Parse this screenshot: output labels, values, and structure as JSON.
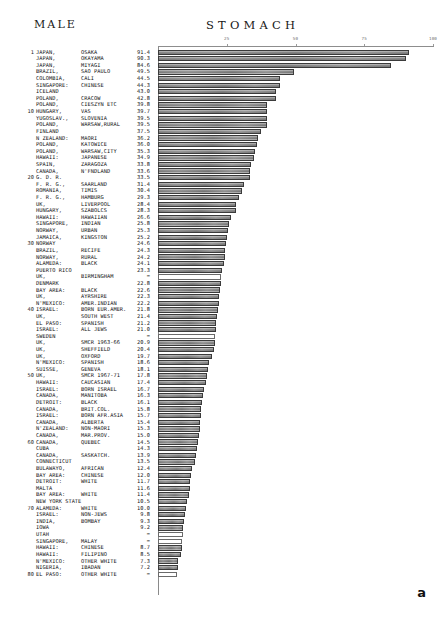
{
  "header": {
    "sex": "MALE",
    "site": "STOMACH"
  },
  "figure_label": "a",
  "chart_data": {
    "type": "bar",
    "title": "STOMACH",
    "subtitle": "MALE",
    "orientation": "horizontal",
    "xlabel": "",
    "ylabel": "",
    "xlim": [
      0,
      100
    ],
    "ticks": [
      25,
      50,
      75,
      100
    ],
    "tick_labels": [
      "25",
      "50",
      "75",
      "100"
    ],
    "grid": false,
    "legend": "none",
    "missing_value_marker": "=",
    "categories": [
      "JAPAN, OSAKA",
      "JAPAN, OKAYAMA",
      "JAPAN, MIYAGI",
      "BRAZIL, SAO PAULO",
      "COLOMBIA, CALI",
      "SINGAPORE: CHINESE",
      "ICELAND",
      "POLAND, CRACOW",
      "POLAND, CIESZYN ETC",
      "HUNGARY, VAS",
      "YUGOSLAV., SLOVENIA",
      "POLAND, WARSAW,RURAL",
      "FINLAND",
      "N ZEALAND: MAORI",
      "POLAND, KATOWICE",
      "POLAND, WARSAW,CITY",
      "HAWAII: JAPANESE",
      "SPAIN, ZARAGOZA",
      "CANADA, N'FNDLAND",
      "G. D. R.",
      "F. R. G., SAARLAND",
      "ROMANIA, TIMIS",
      "F. R. G., HAMBURG",
      "UK, LIVERPOOL",
      "HUNGARY, SZABOLCS",
      "HAWAII: HAWAIIAN",
      "SINGAPORE, INDIAN",
      "NORWAY, URBAN",
      "JAMAICA, KINGSTON",
      "NORWAY",
      "BRAZIL, RECIFE",
      "NORWAY, RURAL",
      "ALAMEDA: BLACK",
      "PUERTO RICO",
      "UK, BIRMINGHAM",
      "DENMARK",
      "BAY AREA: BLACK",
      "UK, AYRSHIRE",
      "N'MEXICO: AMER.INDIAN",
      "ISRAEL: BORN EUR.AMER.",
      "UK, SOUTH WEST",
      "EL PASO: SPANISH",
      "ISRAEL: ALL JEWS",
      "SWEDEN",
      "UK, SMCR 1963-66",
      "UK, SHEFFIELD",
      "UK, OXFORD",
      "N'MEXICO: SPANISH",
      "SUISSE, GENEVA",
      "UK, SMCR 1967-71",
      "HAWAII: CAUCASIAN",
      "ISRAEL: BORN ISRAEL",
      "CANADA, MANITOBA",
      "DETROIT: BLACK",
      "CANADA, BRIT.COL.",
      "ISRAEL: BORN AFR.ASIA",
      "CANADA, ALBERTA",
      "N'ZEALAND: NON-MAORI",
      "CANADA, MAR.PROV.",
      "CANADA, QUEBEC",
      "CUBA",
      "CANADA, SASKATCH.",
      "CONNECTICUT",
      "BULAWAYO, AFRICAN",
      "BAY AREA: CHINESE",
      "DETROIT: WHITE",
      "MALTA",
      "BAY AREA: WHITE",
      "NEW YORK STATE",
      "ALAMEDA: WHITE",
      "ISRAEL: NON-JEWS",
      "INDIA, BOMBAY",
      "IOWA",
      "UTAH",
      "SINGAPORE, MALAY",
      "HAWAII: CHINESE",
      "HAWAII: FILIPINO",
      "N'MEXICO: OTHER WHITE",
      "NIGERIA, IBADAN",
      "EL PASO: OTHER WHITE"
    ],
    "values": [
      91.4,
      90.3,
      84.6,
      49.5,
      44.5,
      44.3,
      43.0,
      42.8,
      39.8,
      39.7,
      39.5,
      39.5,
      37.5,
      36.2,
      36.0,
      35.3,
      34.9,
      33.8,
      33.6,
      33.5,
      31.4,
      30.4,
      29.3,
      28.4,
      28.3,
      26.6,
      25.8,
      25.3,
      25.2,
      24.6,
      24.3,
      24.2,
      24.1,
      23.3,
      null,
      22.8,
      22.6,
      22.3,
      22.2,
      21.8,
      21.4,
      21.2,
      21.0,
      null,
      20.9,
      20.4,
      19.7,
      18.6,
      18.1,
      17.8,
      17.4,
      16.7,
      16.3,
      16.1,
      15.8,
      15.7,
      15.4,
      15.3,
      15.0,
      14.5,
      14.3,
      13.9,
      13.5,
      12.4,
      12.0,
      11.7,
      11.6,
      11.4,
      10.5,
      10.0,
      9.8,
      9.3,
      9.2,
      null,
      null,
      8.7,
      8.5,
      7.3,
      7.2,
      null
    ]
  },
  "rows": [
    {
      "rank": "1",
      "country": "JAPAN,",
      "region": "OSAKA",
      "value": "91.4",
      "v": 91.4
    },
    {
      "rank": "",
      "country": "JAPAN,",
      "region": "OKAYAMA",
      "value": "90.3",
      "v": 90.3
    },
    {
      "rank": "",
      "country": "JAPAN,",
      "region": "MIYAGI",
      "value": "84.6",
      "v": 84.6
    },
    {
      "rank": "",
      "country": "BRAZIL,",
      "region": "SAO PAULO",
      "value": "49.5",
      "v": 49.5
    },
    {
      "rank": "",
      "country": "COLOMBIA,",
      "region": "CALI",
      "value": "44.5",
      "v": 44.5
    },
    {
      "rank": "",
      "country": "SINGAPORE:",
      "region": "CHINESE",
      "value": "44.3",
      "v": 44.3
    },
    {
      "rank": "",
      "country": "ICELAND",
      "region": "",
      "value": "43.0",
      "v": 43.0
    },
    {
      "rank": "",
      "country": "POLAND,",
      "region": "CRACOW",
      "value": "42.8",
      "v": 42.8
    },
    {
      "rank": "",
      "country": "POLAND,",
      "region": "CIESZYN ETC",
      "value": "39.8",
      "v": 39.8
    },
    {
      "rank": "10",
      "country": "HUNGARY,",
      "region": "VAS",
      "value": "39.7",
      "v": 39.7
    },
    {
      "rank": "",
      "country": "YUGOSLAV.,",
      "region": "SLOVENIA",
      "value": "39.5",
      "v": 39.5
    },
    {
      "rank": "",
      "country": "POLAND,",
      "region": "WARSAW,RURAL",
      "value": "39.5",
      "v": 39.5
    },
    {
      "rank": "",
      "country": "FINLAND",
      "region": "",
      "value": "37.5",
      "v": 37.5
    },
    {
      "rank": "",
      "country": "N ZEALAND:",
      "region": "MAORI",
      "value": "36.2",
      "v": 36.2
    },
    {
      "rank": "",
      "country": "POLAND,",
      "region": "KATOWICE",
      "value": "36.0",
      "v": 36.0
    },
    {
      "rank": "",
      "country": "POLAND,",
      "region": "WARSAW,CITY",
      "value": "35.3",
      "v": 35.3
    },
    {
      "rank": "",
      "country": "HAWAII:",
      "region": "JAPANESE",
      "value": "34.9",
      "v": 34.9
    },
    {
      "rank": "",
      "country": "SPAIN,",
      "region": "ZARAGOZA",
      "value": "33.8",
      "v": 33.8
    },
    {
      "rank": "",
      "country": "CANADA,",
      "region": "N'FNDLAND",
      "value": "33.6",
      "v": 33.6
    },
    {
      "rank": "20",
      "country": "G. D. R.",
      "region": "",
      "value": "33.5",
      "v": 33.5
    },
    {
      "rank": "",
      "country": "F. R. G.,",
      "region": "SAARLAND",
      "value": "31.4",
      "v": 31.4
    },
    {
      "rank": "",
      "country": "ROMANIA,",
      "region": "TIMIS",
      "value": "30.4",
      "v": 30.4
    },
    {
      "rank": "",
      "country": "F. R. G.,",
      "region": "HAMBURG",
      "value": "29.3",
      "v": 29.3
    },
    {
      "rank": "",
      "country": "UK,",
      "region": "LIVERPOOL",
      "value": "28.4",
      "v": 28.4
    },
    {
      "rank": "",
      "country": "HUNGARY,",
      "region": "SZABOLCS",
      "value": "28.3",
      "v": 28.3
    },
    {
      "rank": "",
      "country": "HAWAII:",
      "region": "HAWAIIAN",
      "value": "26.6",
      "v": 26.6
    },
    {
      "rank": "",
      "country": "SINGAPORE,",
      "region": "INDIAN",
      "value": "25.8",
      "v": 25.8
    },
    {
      "rank": "",
      "country": "NORWAY,",
      "region": "URBAN",
      "value": "25.3",
      "v": 25.3
    },
    {
      "rank": "",
      "country": "JAMAICA,",
      "region": "KINGSTON",
      "value": "25.2",
      "v": 25.2
    },
    {
      "rank": "30",
      "country": "NORWAY",
      "region": "",
      "value": "24.6",
      "v": 24.6
    },
    {
      "rank": "",
      "country": "BRAZIL,",
      "region": "RECIFE",
      "value": "24.3",
      "v": 24.3
    },
    {
      "rank": "",
      "country": "NORWAY,",
      "region": "RURAL",
      "value": "24.2",
      "v": 24.2
    },
    {
      "rank": "",
      "country": "ALAMEDA:",
      "region": "BLACK",
      "value": "24.1",
      "v": 24.1
    },
    {
      "rank": "",
      "country": "PUERTO RICO",
      "region": "",
      "value": "23.3",
      "v": 23.3
    },
    {
      "rank": "",
      "country": "UK,",
      "region": "BIRMINGHAM",
      "value": "=",
      "v": 23.0
    },
    {
      "rank": "",
      "country": "DENMARK",
      "region": "",
      "value": "22.8",
      "v": 22.8
    },
    {
      "rank": "",
      "country": "BAY AREA:",
      "region": "BLACK",
      "value": "22.6",
      "v": 22.6
    },
    {
      "rank": "",
      "country": "UK,",
      "region": "AYRSHIRE",
      "value": "22.3",
      "v": 22.3
    },
    {
      "rank": "",
      "country": "N'MEXICO:",
      "region": "AMER.INDIAN",
      "value": "22.2",
      "v": 22.2
    },
    {
      "rank": "40",
      "country": "ISRAEL:",
      "region": "BORN EUR.AMER.",
      "value": "21.8",
      "v": 21.8
    },
    {
      "rank": "",
      "country": "UK,",
      "region": "SOUTH WEST",
      "value": "21.4",
      "v": 21.4
    },
    {
      "rank": "",
      "country": "EL PASO:",
      "region": "SPANISH",
      "value": "21.2",
      "v": 21.2
    },
    {
      "rank": "",
      "country": "ISRAEL:",
      "region": "ALL JEWS",
      "value": "21.0",
      "v": 21.0
    },
    {
      "rank": "",
      "country": "SWEDEN",
      "region": "",
      "value": "=",
      "v": 20.9
    },
    {
      "rank": "",
      "country": "UK,",
      "region": "SMCR 1963-66",
      "value": "20.9",
      "v": 20.9
    },
    {
      "rank": "",
      "country": "UK,",
      "region": "SHEFFIELD",
      "value": "20.4",
      "v": 20.4
    },
    {
      "rank": "",
      "country": "UK,",
      "region": "OXFORD",
      "value": "19.7",
      "v": 19.7
    },
    {
      "rank": "",
      "country": "N'MEXICO:",
      "region": "SPANISH",
      "value": "18.6",
      "v": 18.6
    },
    {
      "rank": "",
      "country": "SUISSE,",
      "region": "GENEVA",
      "value": "18.1",
      "v": 18.1
    },
    {
      "rank": "50",
      "country": "UK,",
      "region": "SMCR 1967-71",
      "value": "17.8",
      "v": 17.8
    },
    {
      "rank": "",
      "country": "HAWAII:",
      "region": "CAUCASIAN",
      "value": "17.4",
      "v": 17.4
    },
    {
      "rank": "",
      "country": "ISRAEL:",
      "region": "BORN ISRAEL",
      "value": "16.7",
      "v": 16.7
    },
    {
      "rank": "",
      "country": "CANADA,",
      "region": "MANITOBA",
      "value": "16.3",
      "v": 16.3
    },
    {
      "rank": "",
      "country": "DETROIT:",
      "region": "BLACK",
      "value": "16.1",
      "v": 16.1
    },
    {
      "rank": "",
      "country": "CANADA,",
      "region": "BRIT.COL.",
      "value": "15.8",
      "v": 15.8
    },
    {
      "rank": "",
      "country": "ISRAEL:",
      "region": "BORN AFR.ASIA",
      "value": "15.7",
      "v": 15.7
    },
    {
      "rank": "",
      "country": "CANADA,",
      "region": "ALBERTA",
      "value": "15.4",
      "v": 15.4
    },
    {
      "rank": "",
      "country": "N'ZEALAND:",
      "region": "NON-MAORI",
      "value": "15.3",
      "v": 15.3
    },
    {
      "rank": "",
      "country": "CANADA,",
      "region": "MAR.PROV.",
      "value": "15.0",
      "v": 15.0
    },
    {
      "rank": "60",
      "country": "CANADA,",
      "region": "QUEBEC",
      "value": "14.5",
      "v": 14.5
    },
    {
      "rank": "",
      "country": "CUBA",
      "region": "",
      "value": "14.3",
      "v": 14.3
    },
    {
      "rank": "",
      "country": "CANADA,",
      "region": "SASKATCH.",
      "value": "13.9",
      "v": 13.9
    },
    {
      "rank": "",
      "country": "CONNECTICUT",
      "region": "",
      "value": "13.5",
      "v": 13.5
    },
    {
      "rank": "",
      "country": "BULAWAYO,",
      "region": "AFRICAN",
      "value": "12.4",
      "v": 12.4
    },
    {
      "rank": "",
      "country": "BAY AREA:",
      "region": "CHINESE",
      "value": "12.0",
      "v": 12.0
    },
    {
      "rank": "",
      "country": "DETROIT:",
      "region": "WHITE",
      "value": "11.7",
      "v": 11.7
    },
    {
      "rank": "",
      "country": "MALTA",
      "region": "",
      "value": "11.6",
      "v": 11.6
    },
    {
      "rank": "",
      "country": "BAY AREA:",
      "region": "WHITE",
      "value": "11.4",
      "v": 11.4
    },
    {
      "rank": "",
      "country": "NEW YORK STATE",
      "region": "",
      "value": "10.5",
      "v": 10.5
    },
    {
      "rank": "70",
      "country": "ALAMEDA:",
      "region": "WHITE",
      "value": "10.0",
      "v": 10.0
    },
    {
      "rank": "",
      "country": "ISRAEL:",
      "region": "NON-JEWS",
      "value": "9.8",
      "v": 9.8
    },
    {
      "rank": "",
      "country": "INDIA,",
      "region": "BOMBAY",
      "value": "9.3",
      "v": 9.3
    },
    {
      "rank": "",
      "country": "IOWA",
      "region": "",
      "value": "9.2",
      "v": 9.2
    },
    {
      "rank": "",
      "country": "UTAH",
      "region": "",
      "value": "=",
      "v": 9.0
    },
    {
      "rank": "",
      "country": "SINGAPORE,",
      "region": "MALAY",
      "value": "=",
      "v": 8.8
    },
    {
      "rank": "",
      "country": "HAWAII:",
      "region": "CHINESE",
      "value": "8.7",
      "v": 8.7
    },
    {
      "rank": "",
      "country": "HAWAII:",
      "region": "FILIPINO",
      "value": "8.5",
      "v": 8.5
    },
    {
      "rank": "",
      "country": "N'MEXICO:",
      "region": "OTHER WHITE",
      "value": "7.3",
      "v": 7.3
    },
    {
      "rank": "",
      "country": "NIGERIA,",
      "region": "IBADAN",
      "value": "7.2",
      "v": 7.2
    },
    {
      "rank": "80",
      "country": "EL PASO:",
      "region": "OTHER WHITE",
      "value": "=",
      "v": 7.0
    }
  ]
}
